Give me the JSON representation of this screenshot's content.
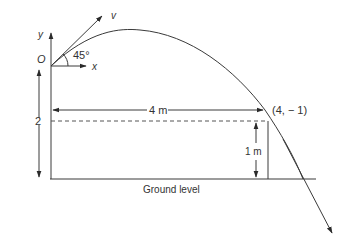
{
  "diagram": {
    "colors": {
      "stroke": "#3a3a3a",
      "text": "#333333",
      "background": "#ffffff"
    },
    "axes": {
      "y_label": "y",
      "x_label": "x",
      "origin_label": "O"
    },
    "launch": {
      "angle_label": "45°",
      "velocity_label": "v"
    },
    "dimensions": {
      "height_label": "2",
      "horizontal_label": "4 m",
      "drop_label": "1 m"
    },
    "point": {
      "label": "(4, − 1)"
    },
    "ground": {
      "label": "Ground level"
    }
  }
}
